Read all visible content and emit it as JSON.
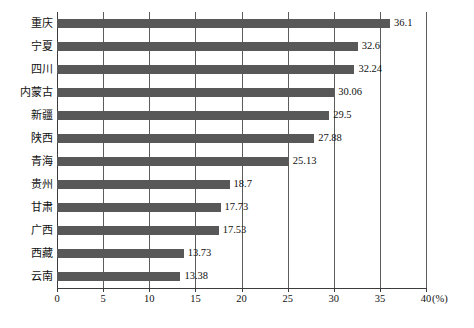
{
  "chart_data": {
    "type": "bar",
    "orientation": "horizontal",
    "title": "",
    "xlabel": "(%)",
    "ylabel": "",
    "xlim": [
      0,
      40
    ],
    "xticks": [
      0,
      5,
      10,
      15,
      20,
      25,
      30,
      35,
      40
    ],
    "xtick_labels": [
      "0",
      "5",
      "10",
      "15",
      "20",
      "25",
      "30",
      "35",
      "40"
    ],
    "grid": true,
    "grid_axis": "x",
    "legend": "none",
    "bar_color": "#585858",
    "categories": [
      "重庆",
      "宁夏",
      "四川",
      "内蒙古",
      "新疆",
      "陕西",
      "青海",
      "贵州",
      "甘肃",
      "广西",
      "西藏",
      "云南"
    ],
    "values": [
      36.1,
      32.6,
      32.24,
      30.06,
      29.5,
      27.88,
      25.13,
      18.7,
      17.73,
      17.53,
      13.73,
      13.38
    ],
    "value_labels": [
      "36.1",
      "32.6",
      "32.24",
      "30.06",
      "29.5",
      "27.88",
      "25.13",
      "18.7",
      "17.73",
      "17.53",
      "13.73",
      "13.38"
    ]
  },
  "axis": {
    "unit_label": "(%)"
  },
  "caption": {
    "text": ""
  }
}
